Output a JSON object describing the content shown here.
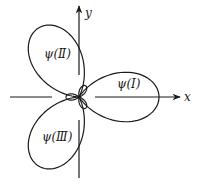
{
  "figure": {
    "axes": {
      "x_label": "x",
      "y_label": "y"
    },
    "lobes": [
      {
        "id": "I",
        "label": "ψ(Ⅰ)",
        "direction_deg": 0,
        "size": "large"
      },
      {
        "id": "II",
        "label": "ψ(Ⅱ)",
        "direction_deg": 120,
        "size": "large"
      },
      {
        "id": "III",
        "label": "ψ(Ⅲ)",
        "direction_deg": 240,
        "size": "large"
      },
      {
        "id": "small-1",
        "label": "",
        "direction_deg": 60,
        "size": "small"
      },
      {
        "id": "small-2",
        "label": "",
        "direction_deg": 180,
        "size": "small"
      },
      {
        "id": "small-3",
        "label": "",
        "direction_deg": 300,
        "size": "small"
      }
    ],
    "line_color": "#1a1a1a"
  }
}
